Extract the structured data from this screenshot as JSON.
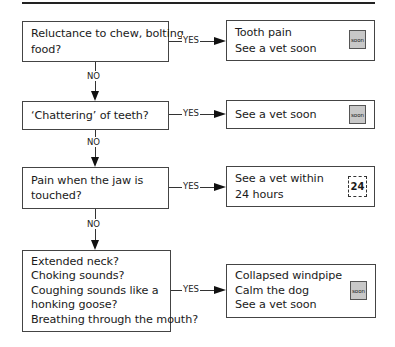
{
  "flowchart": {
    "connector_labels": {
      "yes": "YES",
      "no": "NO"
    },
    "questions": [
      {
        "lines": [
          "Reluctance to chew, bolting",
          "food?"
        ]
      },
      {
        "lines": [
          "‘Chattering’ of teeth?"
        ]
      },
      {
        "lines": [
          "Pain when the jaw is",
          "touched?"
        ]
      },
      {
        "lines": [
          "Extended neck?",
          "Choking sounds?",
          "Coughing sounds like a",
          "honking goose?",
          "Breathing through the mouth?"
        ]
      }
    ],
    "outcomes": [
      {
        "lines": [
          "Tooth pain",
          "See a vet soon"
        ],
        "badge": "soon",
        "badge_type": "soon-icon"
      },
      {
        "lines": [
          "See a vet soon"
        ],
        "badge": "soon",
        "badge_type": "soon-icon"
      },
      {
        "lines": [
          "See a vet within",
          "24 hours"
        ],
        "badge": "24",
        "badge_type": "24-hours-icon"
      },
      {
        "lines": [
          "Collapsed windpipe",
          "Calm the dog",
          "See a vet soon"
        ],
        "badge": "soon",
        "badge_type": "soon-icon"
      }
    ]
  }
}
